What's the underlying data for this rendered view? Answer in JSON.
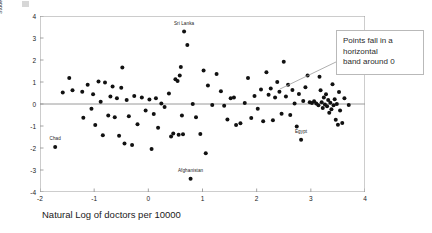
{
  "chart_data": {
    "type": "scatter",
    "title": "",
    "xlabel": "Natural Log of doctors per 10000",
    "ylabel": "Studentized Deleted Residual",
    "xlim": [
      -2,
      4
    ],
    "ylim": [
      -4,
      4
    ],
    "xticks": [
      -2,
      -1,
      0,
      1,
      2,
      3,
      4
    ],
    "xtick_labels": [
      "-2",
      "-1",
      "0",
      "1",
      "2",
      "3",
      "4"
    ],
    "yticks": [
      -4,
      -3,
      -2,
      -1,
      0,
      1,
      2,
      3,
      4
    ],
    "ytick_labels": [
      "-4",
      "-3",
      "-2",
      "-1",
      "0",
      "1",
      "2",
      "3",
      "4"
    ],
    "grid": false,
    "legend": null,
    "reference_lines": [
      {
        "name": "zero-residual-line",
        "orientation": "horizontal",
        "y": 0,
        "color": "#9a9a9a"
      }
    ],
    "marker": {
      "shape": "circle",
      "color": "#111111",
      "size": 2.0
    },
    "points": [
      {
        "x": -1.72,
        "y": -1.95
      },
      {
        "x": -1.58,
        "y": 0.52
      },
      {
        "x": -1.46,
        "y": 1.18
      },
      {
        "x": -1.4,
        "y": 0.62
      },
      {
        "x": -1.22,
        "y": 0.56
      },
      {
        "x": -1.2,
        "y": -0.62
      },
      {
        "x": -1.12,
        "y": 0.88
      },
      {
        "x": -1.05,
        "y": -0.22
      },
      {
        "x": -1.02,
        "y": 0.44
      },
      {
        "x": -0.98,
        "y": -0.95
      },
      {
        "x": -0.92,
        "y": 1.02
      },
      {
        "x": -0.88,
        "y": 0.1
      },
      {
        "x": -0.84,
        "y": -1.42
      },
      {
        "x": -0.8,
        "y": 0.98
      },
      {
        "x": -0.74,
        "y": -0.52
      },
      {
        "x": -0.7,
        "y": 0.34
      },
      {
        "x": -0.66,
        "y": 0.8
      },
      {
        "x": -0.62,
        "y": -0.6
      },
      {
        "x": -0.58,
        "y": 0.26
      },
      {
        "x": -0.54,
        "y": -1.44
      },
      {
        "x": -0.5,
        "y": 0.74
      },
      {
        "x": -0.48,
        "y": 1.66
      },
      {
        "x": -0.44,
        "y": -1.8
      },
      {
        "x": -0.4,
        "y": 0.18
      },
      {
        "x": -0.36,
        "y": -0.56
      },
      {
        "x": -0.3,
        "y": -1.86
      },
      {
        "x": -0.26,
        "y": 0.36
      },
      {
        "x": -0.2,
        "y": -0.92
      },
      {
        "x": -0.12,
        "y": 0.3
      },
      {
        "x": -0.05,
        "y": -0.3
      },
      {
        "x": 0.02,
        "y": 0.2
      },
      {
        "x": 0.06,
        "y": -2.05
      },
      {
        "x": 0.1,
        "y": -0.46
      },
      {
        "x": 0.14,
        "y": 0.26
      },
      {
        "x": 0.18,
        "y": -1.08
      },
      {
        "x": 0.24,
        "y": 0.02
      },
      {
        "x": 0.3,
        "y": -0.14
      },
      {
        "x": 0.38,
        "y": 0.48
      },
      {
        "x": 0.42,
        "y": -1.48
      },
      {
        "x": 0.46,
        "y": -1.34
      },
      {
        "x": 0.5,
        "y": 1.12
      },
      {
        "x": 0.54,
        "y": 1.05
      },
      {
        "x": 0.56,
        "y": -1.4
      },
      {
        "x": 0.58,
        "y": 1.3
      },
      {
        "x": 0.6,
        "y": 1.68
      },
      {
        "x": 0.62,
        "y": -0.52
      },
      {
        "x": 0.64,
        "y": -1.38
      },
      {
        "x": 0.66,
        "y": 3.3
      },
      {
        "x": 0.72,
        "y": 2.68
      },
      {
        "x": 0.78,
        "y": -3.4
      },
      {
        "x": 0.82,
        "y": 0.0
      },
      {
        "x": 0.88,
        "y": -0.6
      },
      {
        "x": 0.96,
        "y": -1.36
      },
      {
        "x": 1.02,
        "y": 1.52
      },
      {
        "x": 1.06,
        "y": -2.24
      },
      {
        "x": 1.1,
        "y": 0.84
      },
      {
        "x": 1.18,
        "y": -0.05
      },
      {
        "x": 1.26,
        "y": 1.36
      },
      {
        "x": 1.34,
        "y": 0.58
      },
      {
        "x": 1.4,
        "y": -0.08
      },
      {
        "x": 1.46,
        "y": -0.7
      },
      {
        "x": 1.52,
        "y": 0.26
      },
      {
        "x": 1.58,
        "y": 0.3
      },
      {
        "x": 1.62,
        "y": -0.96
      },
      {
        "x": 1.7,
        "y": -0.88
      },
      {
        "x": 1.78,
        "y": 0.04
      },
      {
        "x": 1.84,
        "y": 1.18
      },
      {
        "x": 1.9,
        "y": -0.64
      },
      {
        "x": 1.96,
        "y": 0.36
      },
      {
        "x": 2.02,
        "y": -0.22
      },
      {
        "x": 2.08,
        "y": 0.66
      },
      {
        "x": 2.12,
        "y": -0.78
      },
      {
        "x": 2.18,
        "y": 1.44
      },
      {
        "x": 2.22,
        "y": 0.42
      },
      {
        "x": 2.26,
        "y": 0.7
      },
      {
        "x": 2.3,
        "y": -0.74
      },
      {
        "x": 2.34,
        "y": 0.3
      },
      {
        "x": 2.38,
        "y": 1.0
      },
      {
        "x": 2.42,
        "y": 0.56
      },
      {
        "x": 2.46,
        "y": -0.44
      },
      {
        "x": 2.5,
        "y": 1.92
      },
      {
        "x": 2.54,
        "y": 0.34
      },
      {
        "x": 2.58,
        "y": 0.88
      },
      {
        "x": 2.62,
        "y": -0.5
      },
      {
        "x": 2.66,
        "y": 0.64
      },
      {
        "x": 2.7,
        "y": 0.02
      },
      {
        "x": 2.74,
        "y": -1.02
      },
      {
        "x": 2.78,
        "y": 0.46
      },
      {
        "x": 2.82,
        "y": -1.62
      },
      {
        "x": 2.86,
        "y": 0.14
      },
      {
        "x": 2.9,
        "y": 0.76
      },
      {
        "x": 2.94,
        "y": 1.3
      },
      {
        "x": 2.98,
        "y": 0.08
      },
      {
        "x": 3.02,
        "y": 0.04
      },
      {
        "x": 3.06,
        "y": 0.12
      },
      {
        "x": 3.1,
        "y": 0.02
      },
      {
        "x": 3.14,
        "y": -0.06
      },
      {
        "x": 3.16,
        "y": 1.24
      },
      {
        "x": 3.18,
        "y": 0.62
      },
      {
        "x": 3.2,
        "y": 0.08
      },
      {
        "x": 3.22,
        "y": -0.18
      },
      {
        "x": 3.24,
        "y": 0.3
      },
      {
        "x": 3.26,
        "y": -0.02
      },
      {
        "x": 3.28,
        "y": 0.44
      },
      {
        "x": 3.3,
        "y": -0.1
      },
      {
        "x": 3.32,
        "y": 0.18
      },
      {
        "x": 3.34,
        "y": -0.4
      },
      {
        "x": 3.36,
        "y": 0.06
      },
      {
        "x": 3.38,
        "y": -0.24
      },
      {
        "x": 3.4,
        "y": 0.9
      },
      {
        "x": 3.42,
        "y": -0.06
      },
      {
        "x": 3.44,
        "y": 0.22
      },
      {
        "x": 3.46,
        "y": -0.72
      },
      {
        "x": 3.48,
        "y": 0.0
      },
      {
        "x": 3.5,
        "y": -0.94
      },
      {
        "x": 3.52,
        "y": 0.54
      },
      {
        "x": 3.54,
        "y": -0.3
      },
      {
        "x": 3.58,
        "y": -0.86
      },
      {
        "x": 3.62,
        "y": 0.26
      },
      {
        "x": 3.7,
        "y": -0.04
      }
    ],
    "annotations": [
      {
        "name": "sri-lanka",
        "text": "Sri Lanka",
        "x": 0.66,
        "y": 3.3,
        "dy": 0.3
      },
      {
        "name": "chad",
        "text": "Chad",
        "x": -1.72,
        "y": -1.95,
        "dy": 0.3
      },
      {
        "name": "afghanistan",
        "text": "Afghanistan",
        "x": 0.78,
        "y": -3.4,
        "dy": 0.3
      },
      {
        "name": "egypt",
        "text": "Egypt",
        "x": 2.82,
        "y": -1.62,
        "dy": 0.3
      }
    ]
  },
  "callout": {
    "lines": [
      "Points fall in a",
      "horizontal",
      "band around 0"
    ],
    "border_color": "#b9b9b9",
    "text_color": "#2b2b2b"
  }
}
